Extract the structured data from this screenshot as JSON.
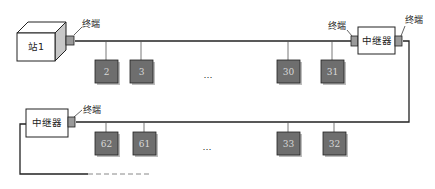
{
  "diagram": {
    "type": "bus-network-with-repeaters",
    "station": {
      "label": "站1"
    },
    "terminator_label": "终端",
    "repeater_label": "中继器",
    "ellipsis": "…",
    "top_segment_nodes": [
      "2",
      "3",
      "30",
      "31"
    ],
    "bottom_segment_nodes": [
      "62",
      "61",
      "33",
      "32"
    ],
    "colors": {
      "node_fill": "#6e6e6e",
      "node_shadow": "#bdbdbd",
      "line": "#222222",
      "terminator_fill": "#9a9a9a",
      "box_fill": "#ffffff"
    }
  }
}
